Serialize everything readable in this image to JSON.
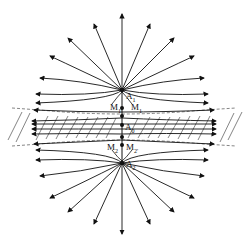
{
  "diagram": {
    "type": "field-line diagram",
    "labels": {
      "A1": "A",
      "A1_sub": "1",
      "M1": "M",
      "M1_sub": "1",
      "M1p": "M",
      "M1p_sub": "1'",
      "A0": "A",
      "A0_sub": "0",
      "M2": "M",
      "M2_sub": "2",
      "M2p": "M",
      "M2p_sub": "2'",
      "A2": "A",
      "A2_sub": "2"
    },
    "points": {
      "A1": [
        122,
        90
      ],
      "M1": [
        122,
        107
      ],
      "A0": [
        122,
        125
      ],
      "M2": [
        122,
        145
      ],
      "A2": [
        122,
        163
      ]
    },
    "colors": {
      "line": "#111111",
      "background": "#ffffff",
      "hatch": "#333333"
    }
  }
}
